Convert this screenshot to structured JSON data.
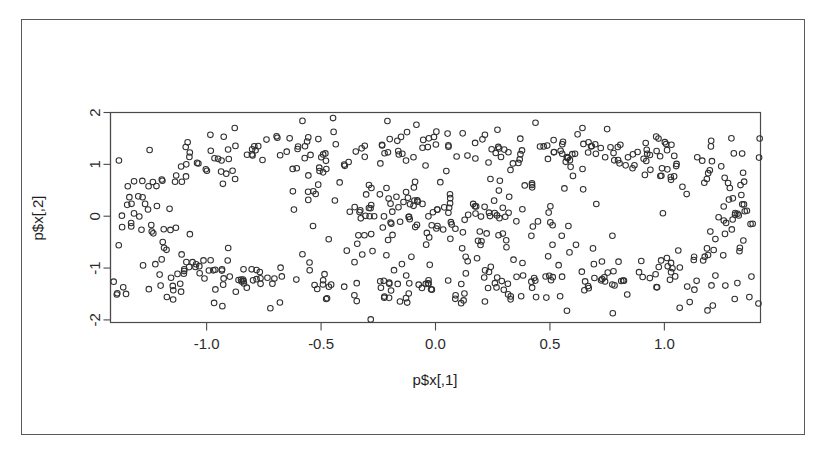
{
  "figure": {
    "kind": "scatter-plot",
    "background_color": "#ffffff",
    "paper_border_color": "#5a5a5a",
    "frame_color": "#4a4a4a",
    "point_stroke_color": "#303030",
    "point_radius_px": 2.8
  },
  "chart_data": {
    "type": "scatter",
    "title": "",
    "xlabel": "p$x[,1]",
    "ylabel": "p$x[,2]",
    "xlim": [
      -1.42,
      1.42
    ],
    "ylim": [
      -2.05,
      2.0
    ],
    "xticks": [
      -1.0,
      -0.5,
      0.0,
      0.5,
      1.0
    ],
    "xticklabels": [
      "-1.0",
      "-0.5",
      "0.0",
      "0.5",
      "1.0"
    ],
    "yticks": [
      -2,
      -1,
      0,
      1,
      2
    ],
    "yticklabels": [
      "-2",
      "-1",
      "0",
      "1",
      "2"
    ],
    "grid": false,
    "legend": null,
    "marker": "open-circle",
    "n_points": 420,
    "series": [
      {
        "name": "p$x",
        "x": [
          -1.34,
          -1.31,
          -1.3,
          -1.29,
          -1.28,
          -1.27,
          -1.26,
          -1.25,
          -1.22,
          -1.2,
          -1.19,
          -1.17,
          -1.15,
          -1.13,
          -1.11,
          -1.1,
          -1.08,
          -1.06,
          -1.05,
          -1.03,
          -1.01,
          -1.0,
          -0.98,
          -0.96,
          -0.95,
          -0.93,
          -0.91,
          -0.9,
          -0.88,
          -0.86,
          -0.85,
          -0.83,
          -0.81,
          -0.8,
          -0.78,
          -0.77,
          -0.75,
          -0.73,
          -0.72,
          -0.7,
          -0.68,
          -0.67,
          -0.65,
          -0.63,
          -0.62,
          -0.6,
          -0.58,
          -0.57,
          -0.55,
          -0.53,
          -0.52,
          -0.5,
          -0.48,
          -0.47,
          -0.45,
          -0.43,
          -0.42,
          -0.4,
          -0.38,
          -0.37,
          -0.35,
          -0.33,
          -0.32,
          -0.3,
          -0.28,
          -0.27,
          -0.25,
          -0.23,
          -0.22,
          -0.2,
          -0.18,
          -0.17,
          -0.15,
          -0.13,
          -0.12,
          -0.1,
          -0.08,
          -0.07,
          -0.05,
          -0.03,
          -0.02,
          0.0,
          0.02,
          0.03,
          0.05,
          0.07,
          0.08,
          0.1,
          0.12,
          0.13,
          0.15,
          0.17,
          0.18,
          0.2,
          0.22,
          0.23,
          0.25,
          0.27,
          0.28,
          0.3,
          0.32,
          0.33,
          0.35,
          0.37,
          0.38,
          0.4,
          0.42,
          0.43,
          0.45,
          0.47,
          0.48,
          0.5,
          0.52,
          0.53,
          0.55,
          0.57,
          0.58,
          0.6,
          0.62,
          0.63,
          0.65,
          0.67,
          0.68,
          0.7,
          0.72,
          0.73,
          0.75,
          0.77,
          0.78,
          0.8,
          0.82,
          0.83,
          0.85,
          0.87,
          0.88,
          0.9,
          0.92,
          0.93,
          0.95,
          0.97,
          0.98,
          1.0,
          1.02,
          1.03,
          1.05,
          1.07,
          1.08,
          1.1,
          1.12,
          1.13,
          1.15,
          1.17,
          1.18,
          1.2,
          1.22,
          1.23,
          1.25,
          1.27,
          1.28,
          1.3,
          1.32,
          1.34,
          1.36
        ],
        "y_upper_band": "approximately 0.75 to 1.95, present across all x",
        "y_lower_band": "approximately -0.70 to -1.95, present across all x",
        "y_middle_band": "approximately -0.65 to 0.70, present only for -0.6 <= x <= 0.7"
      }
    ]
  },
  "axes": {
    "x_axis_label": "p$x[,1]",
    "y_axis_label": "p$x[,2]",
    "x_tick_labels": [
      "-1.0",
      "-0.5",
      "0.0",
      "0.5",
      "1.0"
    ],
    "y_tick_labels": [
      "-2",
      "-1",
      "0",
      "1",
      "2"
    ]
  }
}
